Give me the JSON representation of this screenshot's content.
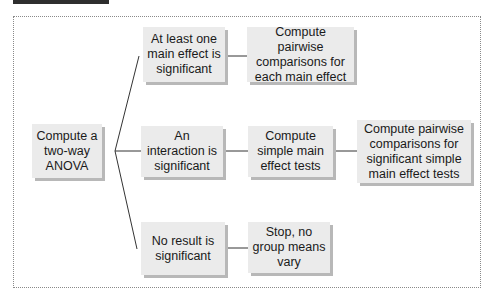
{
  "header": {
    "clipped_caption": ""
  },
  "diagram": {
    "nodes": {
      "start": "Compute a two-way ANOVA",
      "main_effect": "At least one main effect is significant",
      "interaction": "An interaction is significant",
      "no_result": "No result is significant",
      "pairwise_main": "Compute pairwise comparisons for each main effect",
      "simple_main": "Compute simple main effect tests",
      "pairwise_simple": "Compute pairwise comparisons for significant simple main effect tests",
      "stop": "Stop, no group means vary"
    },
    "edges": [
      [
        "start",
        "main_effect"
      ],
      [
        "start",
        "interaction"
      ],
      [
        "start",
        "no_result"
      ],
      [
        "main_effect",
        "pairwise_main"
      ],
      [
        "interaction",
        "simple_main"
      ],
      [
        "simple_main",
        "pairwise_simple"
      ],
      [
        "no_result",
        "stop"
      ]
    ]
  }
}
